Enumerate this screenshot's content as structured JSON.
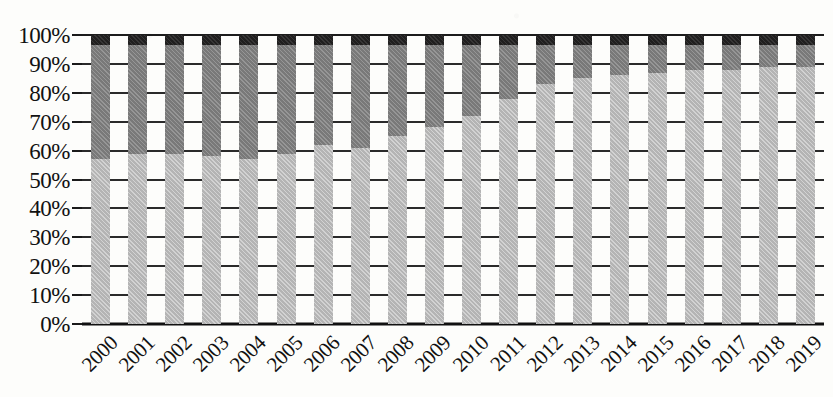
{
  "chart_data": {
    "type": "bar",
    "subtype": "stacked-100-percent",
    "title": "",
    "subtitle": "",
    "xlabel": "",
    "ylabel": "",
    "ylim": [
      0,
      100
    ],
    "y_tick_labels": [
      "0%",
      "10%",
      "20%",
      "30%",
      "40%",
      "50%",
      "60%",
      "70%",
      "80%",
      "90%",
      "100%"
    ],
    "y_tick_values": [
      0,
      10,
      20,
      30,
      40,
      50,
      60,
      70,
      80,
      90,
      100
    ],
    "grid": true,
    "grid_axis": "y",
    "legend": false,
    "legend_position": "none",
    "categories": [
      "2000",
      "2001",
      "2002",
      "2003",
      "2004",
      "2005",
      "2006",
      "2007",
      "2008",
      "2009",
      "2010",
      "2011",
      "2012",
      "2013",
      "2014",
      "2015",
      "2016",
      "2017",
      "2018",
      "2019"
    ],
    "series": [
      {
        "name": "segment-bottom",
        "color": "#b4b4b4",
        "values": [
          57,
          59,
          59,
          58,
          57,
          59,
          62,
          61,
          65,
          68,
          72,
          78,
          83,
          85,
          86,
          87,
          88,
          88,
          89,
          89
        ]
      },
      {
        "name": "segment-middle",
        "color": "#797979",
        "values": [
          39.5,
          37.5,
          37.5,
          38.5,
          39.5,
          37.5,
          34.5,
          35.5,
          31.5,
          28.5,
          24.5,
          18.5,
          13.5,
          11.5,
          10.5,
          9.5,
          8.5,
          8.5,
          7.5,
          7.5
        ]
      },
      {
        "name": "segment-top",
        "color": "#201f1f",
        "values": [
          3.5,
          3.5,
          3.5,
          3.5,
          3.5,
          3.5,
          3.5,
          3.5,
          3.5,
          3.5,
          3.5,
          3.5,
          3.5,
          3.5,
          3.5,
          3.5,
          3.5,
          3.5,
          3.5,
          3.5
        ]
      }
    ]
  },
  "axes": {
    "y_axis_name": "y-axis",
    "x_axis_name": "x-axis"
  }
}
